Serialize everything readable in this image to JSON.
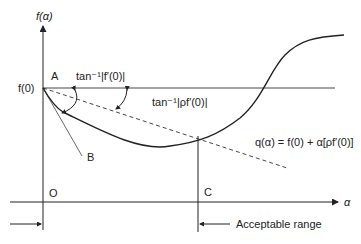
{
  "diagram": {
    "y_axis_label": "f(α)",
    "x_axis_label": "α",
    "f0_label": "f(0)",
    "point_a": "A",
    "point_b": "B",
    "point_o": "O",
    "point_c": "C",
    "angle_label_1": "tan⁻¹|f′(0)|",
    "angle_label_2": "tan⁻¹|ρf′(0)|",
    "line_label": "q(α) = f(0) + α[ρf′(0)]",
    "range_label": "Acceptable range"
  },
  "colors": {
    "line": "#222222",
    "background": "#ffffff"
  }
}
